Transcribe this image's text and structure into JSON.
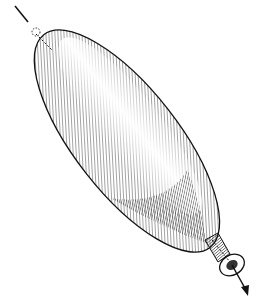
{
  "illustration": {
    "subject": "elongated balloon with neck and axis arrow",
    "style": "black and white engraving with hatching",
    "colors": {
      "background": "#ffffff",
      "ink": "#1a1a1a"
    }
  }
}
